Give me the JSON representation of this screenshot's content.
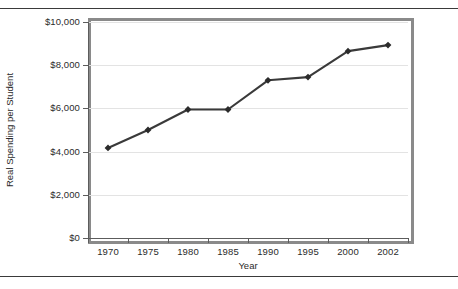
{
  "figure": {
    "has_top_rule": true,
    "has_bottom_rule": true,
    "plot_frame_color": "#8a8a8a",
    "background_color": "#ffffff"
  },
  "chart_data": {
    "type": "line",
    "title": "",
    "subtitle": "",
    "xlabel": "Year",
    "ylabel": "Real Spending per Student",
    "categories": [
      "1970",
      "1975",
      "1980",
      "1985",
      "1990",
      "1995",
      "2000",
      "2002"
    ],
    "values": [
      4170,
      5000,
      5950,
      5950,
      7300,
      7450,
      8650,
      8930
    ],
    "series": [
      {
        "name": "Real Spending per Student",
        "values": [
          4170,
          5000,
          5950,
          5950,
          7300,
          7450,
          8650,
          8930
        ]
      }
    ],
    "ylim": [
      0,
      10000
    ],
    "ytick_values": [
      0,
      2000,
      4000,
      6000,
      8000,
      10000
    ],
    "ytick_labels": [
      "$0",
      "$2,000",
      "$4,000",
      "$6,000",
      "$8,000",
      "$10,000"
    ],
    "xtick_labels": [
      "1970",
      "1975",
      "1980",
      "1985",
      "1990",
      "1995",
      "2000",
      "2002"
    ],
    "grid": true,
    "grid_axis": "y",
    "grid_color": "#e3e3e3",
    "legend": false,
    "legend_position": "none",
    "line_color": "#3a3a3a",
    "marker": "diamond",
    "marker_color": "#2b2b2b",
    "axis_color": "#5c5c5c",
    "text_color": "#2b2b2b"
  }
}
